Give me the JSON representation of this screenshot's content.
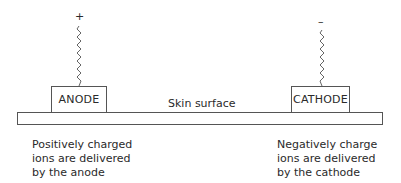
{
  "diagram": {
    "anode": {
      "sign": "+",
      "label": "ANODE",
      "caption": "Positively charged\nions are delivered\nby the anode"
    },
    "cathode": {
      "sign": "–",
      "label": "CATHODE",
      "caption": "Negatively charge\nions are delivered\nby the cathode"
    },
    "skin_label": "Skin surface"
  }
}
